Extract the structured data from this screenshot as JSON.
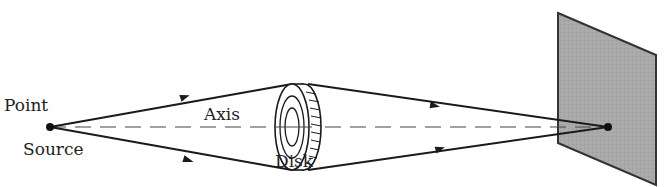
{
  "diagram": {
    "labels": {
      "point": "Point",
      "source": "Source",
      "axis": "Axis",
      "disk": "Disk"
    },
    "elements": [
      {
        "name": "point-source",
        "type": "dot",
        "x": 50,
        "y": 127
      },
      {
        "name": "optical-axis",
        "type": "dashed-line",
        "from": [
          50,
          127
        ],
        "to": [
          608,
          127
        ]
      },
      {
        "name": "opaque-disk",
        "type": "disk",
        "center": [
          295,
          127
        ]
      },
      {
        "name": "screen",
        "type": "parallelogram",
        "fill": "#a8a8a8"
      },
      {
        "name": "bright-spot",
        "type": "dot",
        "x": 608,
        "y": 127
      }
    ],
    "colors": {
      "line": "#1a1a1a",
      "screen_fill": "#a9a9a9",
      "screen_edge": "#333333"
    }
  }
}
